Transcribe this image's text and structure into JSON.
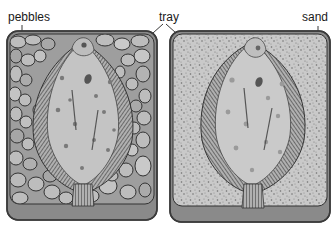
{
  "figure": {
    "type": "illustration",
    "labels": {
      "pebbles": "pebbles",
      "tray": "tray",
      "sand": "sand"
    },
    "panels": [
      {
        "id": "left",
        "substrate": "pebbles",
        "contents": "flatfish"
      },
      {
        "id": "right",
        "substrate": "sand",
        "contents": "flatfish"
      }
    ],
    "colors": {
      "tray_rim": "#555555",
      "tray_lip": "#8a8a8a",
      "pebble_fill": "#b8b8b8",
      "pebble_outline": "#3a3a3a",
      "sand_fill": "#c9c9c9",
      "fish_body": "#c4c4c4",
      "fish_spot": "#7a7a7a",
      "fin": "#4a4a4a"
    }
  }
}
